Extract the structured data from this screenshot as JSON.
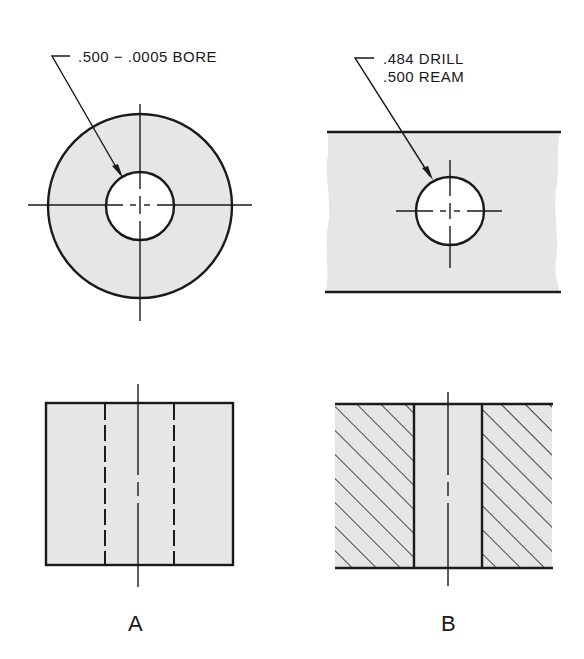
{
  "figures": [
    {
      "id": "A",
      "label": "A",
      "callout": [
        ".500 − .0005 BORE"
      ],
      "plan_view": "round bushing with centered bore, shaded",
      "section_view": "bushing elevation with hidden bore lines (dashed)"
    },
    {
      "id": "B",
      "label": "B",
      "callout": [
        ".484 DRILL",
        ".500 REAM"
      ],
      "plan_view": "plate with drilled and reamed hole, shaded",
      "section_view": "cross-section with hatched material and bore"
    }
  ],
  "colors": {
    "line": "#1a1a1a",
    "fill": "#e6e6e6",
    "background": "#ffffff"
  }
}
